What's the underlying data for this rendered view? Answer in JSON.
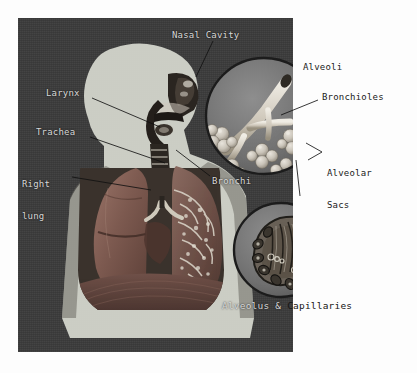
{
  "figure": {
    "panel_color": "#3b3b3b",
    "page_color": "#fdfdfd",
    "label_color_on_dark": "#d8d8d8",
    "label_color_on_light": "#1a1a1a"
  },
  "labels": {
    "nasal_cavity": "Nasal Cavity",
    "larynx": "Larynx",
    "trachea": "Trachea",
    "right_lung_line1": "Right",
    "right_lung_line2": "lung",
    "bronchi": "Bronchi",
    "alveoli": "Alveoli",
    "bronchioles": "Bronchioles",
    "alveolar_sacs_line1": "Alveolar",
    "alveolar_sacs_line2": "Sacs"
  },
  "caption": {
    "part_on_panel": "Alveolus &",
    "part_on_page": "Capillaries"
  },
  "insets": {
    "upper": {
      "name": "alveoli-bronchioles-inset",
      "subject": "bronchiole with alveolar sac clusters"
    },
    "lower": {
      "name": "alveolus-capillaries-inset",
      "subject": "alveolus surrounded by capillary network"
    }
  },
  "anatomy": {
    "silhouette": "head-and-torso profile",
    "organs": [
      "nasal cavity",
      "pharynx",
      "larynx",
      "trachea",
      "left lung (intact)",
      "right lung (sectioned, bronchial tree visible)",
      "bronchi",
      "diaphragm"
    ]
  }
}
